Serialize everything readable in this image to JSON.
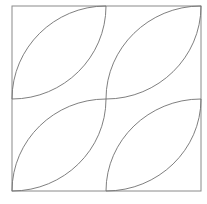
{
  "diagram": {
    "stroke_color": "#707070",
    "frame_color": "#8a8a8a",
    "background": "#ffffff",
    "frame": {
      "x": 12,
      "y": 6,
      "width": 189,
      "height": 185
    },
    "center": {
      "x": 106,
      "y": 99
    },
    "quadrants": [
      {
        "name": "top-left",
        "x0": 12,
        "y0": 6,
        "x1": 106,
        "y1": 99
      },
      {
        "name": "top-right",
        "x0": 106,
        "y0": 6,
        "x1": 201,
        "y1": 99
      },
      {
        "name": "bottom-left",
        "x0": 12,
        "y0": 99,
        "x1": 106,
        "y1": 191
      },
      {
        "name": "bottom-right",
        "x0": 106,
        "y0": 99,
        "x1": 201,
        "y1": 191
      }
    ]
  }
}
